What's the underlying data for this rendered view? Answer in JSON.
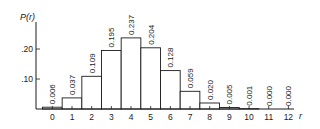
{
  "chart_data": {
    "type": "bar",
    "title": "",
    "xlabel": "r",
    "ylabel": "P(r)",
    "categories": [
      "0",
      "1",
      "2",
      "3",
      "4",
      "5",
      "6",
      "7",
      "8",
      "9",
      "10",
      "11",
      "12"
    ],
    "values": [
      0.006,
      0.037,
      0.109,
      0.195,
      0.237,
      0.204,
      0.128,
      0.059,
      0.02,
      0.005,
      0.001,
      0.0,
      0.0
    ],
    "value_labels": [
      "0.006",
      "0.037",
      "0.109",
      "0.195",
      "0.237",
      "0.204",
      "0.128",
      "0.059",
      "0.020",
      "0.005",
      "0.001",
      "0.000",
      "0.000"
    ],
    "yticks": [
      ".10",
      ".20"
    ],
    "ytick_values": [
      0.1,
      0.2
    ],
    "ylim": [
      0,
      0.28
    ],
    "grid": false,
    "legend": null
  },
  "colors": {
    "ink": "#1a1a1a",
    "bar_fill": "#ffffff",
    "background": "#ffffff"
  }
}
